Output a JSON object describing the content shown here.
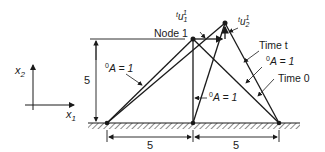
{
  "diagram": {
    "type": "truss-displacement",
    "colors": {
      "ink": "#1a1a1a",
      "background": "#ffffff"
    },
    "axes": {
      "x_label": "x",
      "x_sub": "1",
      "y_label": "x",
      "y_sub": "2"
    },
    "labels": {
      "node1": "Node 1",
      "u1_pre": "t",
      "u1_main": "u",
      "u1_sub": "1",
      "u1_sup": "1",
      "u2_pre": "t",
      "u2_main": "u",
      "u2_sub": "2",
      "u2_sup": "1",
      "time_t": "Time t",
      "time_0": "Time 0",
      "area_left_sup": "0",
      "area_left": "A = 1",
      "area_mid_sup": "0",
      "area_mid": "A = 1",
      "area_right_sup": "0",
      "area_right": "A = 1"
    },
    "dimensions": {
      "height": "5",
      "left_span": "5",
      "right_span": "5"
    }
  }
}
